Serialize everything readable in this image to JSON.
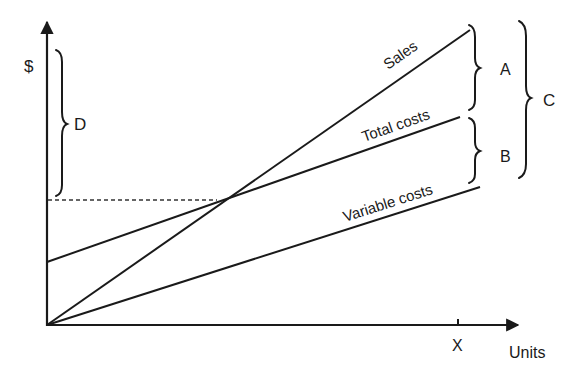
{
  "diagram": {
    "type": "break-even chart",
    "axes": {
      "y_label": "$",
      "x_label": "Units",
      "x_marker": "X"
    },
    "lines": [
      {
        "id": "sales",
        "label": "Sales",
        "from": [
          47,
          325
        ],
        "to": [
          470,
          30
        ]
      },
      {
        "id": "total_costs",
        "label": "Total costs",
        "from": [
          47,
          262
        ],
        "to": [
          460,
          117
        ]
      },
      {
        "id": "variable_costs",
        "label": "Variable costs",
        "from": [
          47,
          325
        ],
        "to": [
          480,
          187
        ]
      }
    ],
    "break_even_point": [
      217,
      200
    ],
    "braces": [
      {
        "id": "D",
        "label": "D",
        "side": "y-axis",
        "meaning": "fixed costs span above break-even"
      },
      {
        "id": "A",
        "label": "A",
        "between": [
          "Sales",
          "Total costs"
        ]
      },
      {
        "id": "B",
        "label": "B",
        "between": [
          "Total costs",
          "Variable costs"
        ]
      },
      {
        "id": "C",
        "label": "C",
        "between": [
          "Sales",
          "Variable costs"
        ]
      }
    ]
  },
  "colors": {
    "ink": "#1a1a1a",
    "background": "#ffffff"
  }
}
